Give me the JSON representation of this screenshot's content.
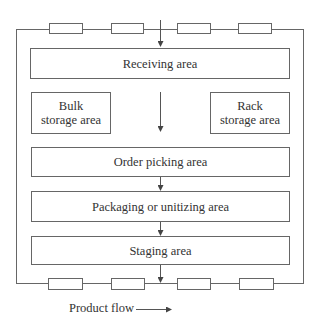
{
  "diagram": {
    "type": "warehouse-layout-flow",
    "areas": {
      "receiving": {
        "label": "Receiving area"
      },
      "bulk_storage": {
        "label_line1": "Bulk",
        "label_line2": "storage area"
      },
      "rack_storage": {
        "label_line1": "Rack",
        "label_line2": "storage area"
      },
      "order_picking": {
        "label": "Order picking area"
      },
      "packaging": {
        "label": "Packaging or unitizing area"
      },
      "staging": {
        "label": "Staging area"
      }
    },
    "docks": {
      "top_count": 4,
      "bottom_count": 4
    },
    "legend": {
      "label": "Product flow",
      "icon": "arrow-right-icon"
    },
    "colors": {
      "line": "#666666",
      "text": "#333333",
      "background": "#ffffff"
    }
  }
}
